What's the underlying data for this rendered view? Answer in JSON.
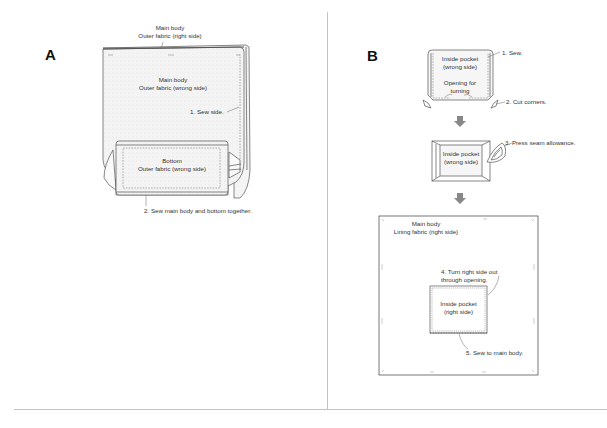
{
  "panels": {
    "a": {
      "letter": "A",
      "outer_label_line1": "Main body",
      "outer_label_line2": "Outer fabric (right side)",
      "inner_label_line1": "Main body",
      "inner_label_line2": "Outer fabric  (wrong side)",
      "step1": "1. Sew side.",
      "bottom_line1": "Bottom",
      "bottom_line2": "Outer fabric (wrong side)",
      "step2": "2. Sew main body and bottom together."
    },
    "b": {
      "letter": "B",
      "pocket1_line1": "Inside pocket",
      "pocket1_line2": "(wrong side)",
      "opening_line1": "Opening for",
      "opening_line2": "turning",
      "step1": "1. Sew.",
      "step2": "2. Cut corners.",
      "pocket2_line1": "Inside pocket",
      "pocket2_line2": "(wrong side)",
      "step3": "3. Press seam allowance.",
      "lining_line1": "Main body",
      "lining_line2": "Lining fabric (right side)",
      "step4_line1": "4. Turn right side out",
      "step4_line2": "through opening.",
      "pocket3_line1": "Inside pocket",
      "pocket3_line2": "(right side)",
      "step5": "5. Sew to main body."
    }
  },
  "colors": {
    "line": "#555555",
    "fabric_fill": "#f2f2f2",
    "arrow": "#888888",
    "divider": "#bbbbbb"
  }
}
